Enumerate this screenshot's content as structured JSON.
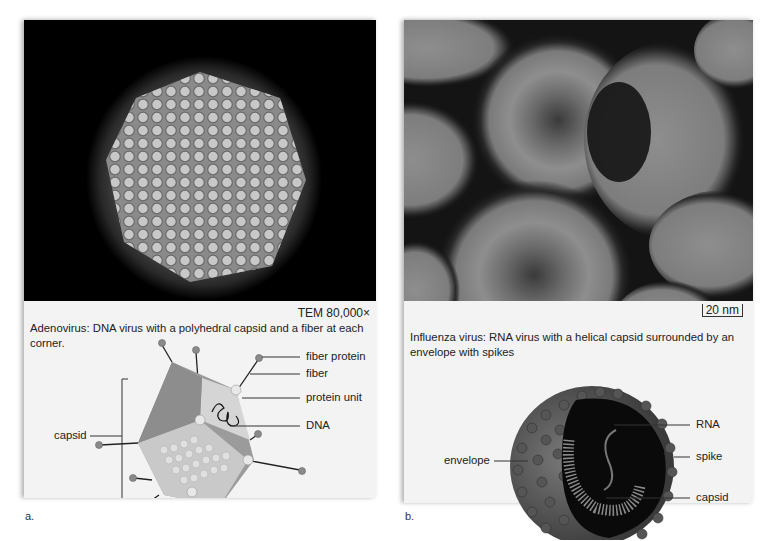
{
  "figure": {
    "panels": [
      {
        "id": "a",
        "letter": "a.",
        "micrograph_subject": "Adenovirus TEM micrograph",
        "magnification": "TEM 80,000×",
        "caption": "Adenovirus: DNA virus with a polyhedral capsid and a fiber at each corner.",
        "labels": {
          "fiber_protein": "fiber protein",
          "fiber": "fiber",
          "protein_unit": "protein unit",
          "dna": "DNA",
          "capsid": "capsid"
        }
      },
      {
        "id": "b",
        "letter": "b.",
        "micrograph_subject": "Influenza virus micrograph",
        "scale_bar": "20 nm",
        "caption_line1": "Influenza virus: RNA virus with a helical capsid surrounded by an",
        "caption_line2": "envelope with spikes",
        "labels": {
          "rna": "RNA",
          "spike": "spike",
          "capsid": "capsid",
          "envelope": "envelope"
        }
      }
    ]
  }
}
